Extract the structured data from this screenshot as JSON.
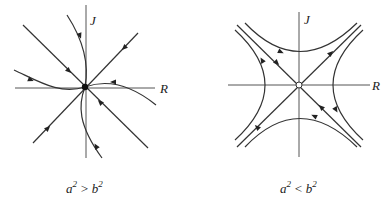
{
  "diagrams": [
    {
      "id": "stable-node",
      "x_axis_label": "R",
      "y_axis_label": "J",
      "caption": {
        "base_a": "a",
        "exp_a": "2",
        "relation": ">",
        "base_b": "b",
        "exp_b": "2"
      },
      "fixed_point": "filled node (all trajectories converge)"
    },
    {
      "id": "saddle",
      "x_axis_label": "R",
      "y_axis_label": "J",
      "caption": {
        "base_a": "a",
        "exp_a": "2",
        "relation": "<",
        "base_b": "b",
        "exp_b": "2"
      },
      "fixed_point": "open circle saddle point"
    }
  ],
  "colors": {
    "line": "#333333",
    "axis": "#555555",
    "background": "#ffffff"
  }
}
